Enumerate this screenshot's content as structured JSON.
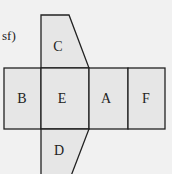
{
  "figure": {
    "corner_label": "sf)",
    "faces": [
      {
        "id": "C",
        "label": "C"
      },
      {
        "id": "B",
        "label": "B"
      },
      {
        "id": "E",
        "label": "E"
      },
      {
        "id": "A",
        "label": "A"
      },
      {
        "id": "F",
        "label": "F"
      },
      {
        "id": "D",
        "label": "D"
      }
    ],
    "colors": {
      "fill": "#e6e6e6",
      "stroke": "#222222",
      "background": "#f1f1f1"
    }
  }
}
